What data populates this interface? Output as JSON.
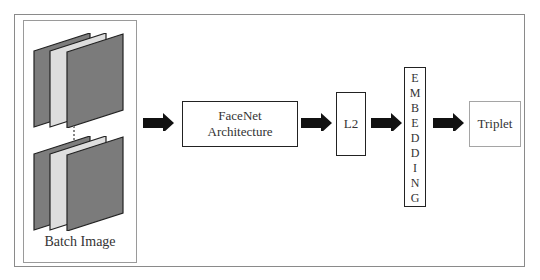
{
  "diagram": {
    "batch": {
      "label": "Batch Image",
      "ellipsis": "⋮"
    },
    "nodes": [
      {
        "id": "facenet",
        "lines": [
          "FaceNet",
          "Architecture"
        ]
      },
      {
        "id": "l2",
        "label": "L2"
      },
      {
        "id": "embedding",
        "letters": [
          "E",
          "M",
          "B",
          "E",
          "D",
          "D",
          "I",
          "N",
          "G"
        ]
      },
      {
        "id": "triplet",
        "label": "Triplet"
      }
    ],
    "colors": {
      "arrow": "#111111",
      "panel_dark": "#7a7a7a",
      "panel_light": "#dcdcdc",
      "border": "#8a8a8a"
    }
  }
}
